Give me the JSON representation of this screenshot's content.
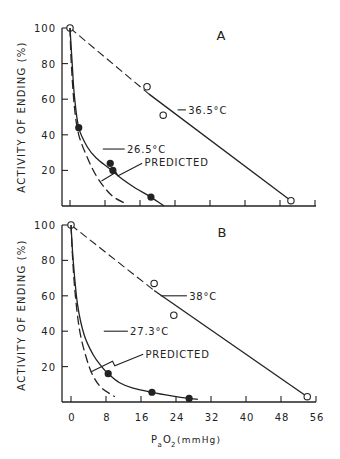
{
  "figure": {
    "y_axis_label": "ACTIVITY OF ENDING (%)",
    "x_axis_label_main": "P",
    "x_axis_label_sub": "a",
    "x_axis_label_rest": "O",
    "x_axis_label_sub2": "2",
    "x_axis_label_unit": " (mmHg)",
    "ink_color": "#222222"
  },
  "chart_data": [
    {
      "type": "line",
      "panel": "A",
      "title": "A",
      "xlabel": "PaO2 (mmHg)",
      "ylabel": "ACTIVITY OF ENDING (%)",
      "xlim": [
        0,
        56
      ],
      "ylim": [
        0,
        100
      ],
      "x_ticks": [
        0,
        8,
        16,
        24,
        32,
        40,
        48,
        56
      ],
      "y_ticks": [
        20,
        40,
        60,
        80,
        100
      ],
      "y_tick_labels": [
        "20",
        "40",
        "60",
        "80",
        "100"
      ],
      "grid": false,
      "series": [
        {
          "name": "36.5°C",
          "marker": "open-circle",
          "points": [
            [
              0,
              100
            ],
            [
              17.6,
              67
            ],
            [
              21.3,
              51
            ],
            [
              50.5,
              3
            ]
          ],
          "fit_line": [
            [
              0,
              100
            ],
            [
              18,
              63
            ],
            [
              50.5,
              3
            ]
          ],
          "fit_dashed_until_x": 18
        },
        {
          "name": "26.5°C",
          "marker": "filled-circle",
          "points": [
            [
              2,
              44
            ],
            [
              9.2,
              24
            ],
            [
              9.8,
              20
            ],
            [
              18.5,
              5
            ]
          ],
          "fit_curve": [
            [
              0,
              100
            ],
            [
              0.5,
              80
            ],
            [
              1,
              62
            ],
            [
              2,
              44
            ],
            [
              4,
              33
            ],
            [
              6,
              27
            ],
            [
              9,
              21
            ],
            [
              12,
              15
            ],
            [
              15,
              10
            ],
            [
              18.5,
              5
            ],
            [
              21.5,
              0
            ]
          ]
        },
        {
          "name": "PREDICTED",
          "style": "dashed",
          "fit_curve": [
            [
              0,
              100
            ],
            [
              0.3,
              80
            ],
            [
              1,
              56
            ],
            [
              2,
              40
            ],
            [
              4,
              27
            ],
            [
              6,
              17
            ],
            [
              8,
              10
            ],
            [
              10,
              5
            ],
            [
              13,
              1
            ]
          ]
        }
      ],
      "annotations": [
        {
          "text": "36.5°C",
          "x": 27,
          "y": 54
        },
        {
          "text": "26.5°C",
          "x": 13,
          "y": 32
        },
        {
          "text": "PREDICTED",
          "x": 17,
          "y": 25
        }
      ]
    },
    {
      "type": "line",
      "panel": "B",
      "title": "B",
      "xlabel": "PaO2 (mmHg)",
      "ylabel": "ACTIVITY OF ENDING (%)",
      "xlim": [
        0,
        56
      ],
      "ylim": [
        0,
        100
      ],
      "x_ticks": [
        0,
        8,
        16,
        24,
        32,
        40,
        48,
        56
      ],
      "x_tick_labels": [
        "0",
        "8",
        "16",
        "24",
        "32",
        "40",
        "48",
        "56"
      ],
      "y_ticks": [
        20,
        40,
        60,
        80,
        100
      ],
      "y_tick_labels": [
        "20",
        "40",
        "60",
        "80",
        "100"
      ],
      "grid": false,
      "series": [
        {
          "name": "38°C",
          "marker": "open-circle",
          "points": [
            [
              0,
              100
            ],
            [
              19,
              67
            ],
            [
              23.5,
              49
            ],
            [
              54,
              3
            ]
          ],
          "fit_line": [
            [
              0,
              100
            ],
            [
              19,
              63
            ],
            [
              54,
              3
            ]
          ],
          "fit_dashed_until_x": 19
        },
        {
          "name": "27.3°C",
          "marker": "filled-circle",
          "points": [
            [
              8.5,
              16
            ],
            [
              18.5,
              5.5
            ],
            [
              27,
              2
            ]
          ],
          "fit_curve": [
            [
              0,
              100
            ],
            [
              0.5,
              80
            ],
            [
              1.5,
              55
            ],
            [
              3,
              38
            ],
            [
              5,
              27
            ],
            [
              7,
              20
            ],
            [
              8.5,
              16
            ],
            [
              11,
              11
            ],
            [
              14,
              8
            ],
            [
              18.5,
              5.5
            ],
            [
              23,
              3.5
            ],
            [
              27,
              2
            ],
            [
              29,
              1.5
            ]
          ]
        },
        {
          "name": "PREDICTED",
          "style": "dashed",
          "fit_curve": [
            [
              0,
              100
            ],
            [
              0.4,
              80
            ],
            [
              1,
              60
            ],
            [
              2,
              40
            ],
            [
              3.5,
              25
            ],
            [
              5,
              15
            ],
            [
              7,
              8
            ],
            [
              10,
              3
            ]
          ]
        }
      ],
      "annotations": [
        {
          "text": "38°C",
          "x": 27,
          "y": 60
        },
        {
          "text": "27.3°C",
          "x": 13.5,
          "y": 40
        },
        {
          "text": "PREDICTED",
          "x": 17,
          "y": 27
        }
      ]
    }
  ]
}
